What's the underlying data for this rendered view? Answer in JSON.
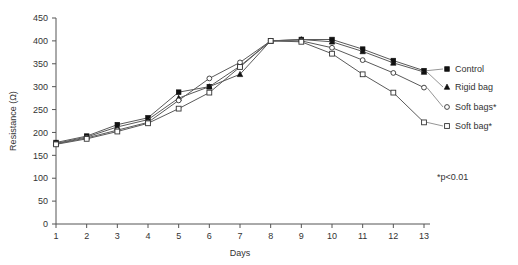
{
  "chart_data": {
    "type": "line",
    "title": "",
    "xlabel": "Days",
    "ylabel": "Resistance (Ω)",
    "x": [
      1,
      2,
      3,
      4,
      5,
      6,
      7,
      8,
      9,
      10,
      11,
      12,
      13
    ],
    "xtick_labels": [
      "1",
      "2",
      "3",
      "4",
      "5",
      "6",
      "7",
      "8",
      "9",
      "10",
      "11",
      "12",
      "13"
    ],
    "ytick_labels": [
      "0",
      "50",
      "100",
      "150",
      "200",
      "250",
      "300",
      "350",
      "400",
      "450"
    ],
    "yticks": [
      0,
      50,
      100,
      150,
      200,
      250,
      300,
      350,
      400,
      450
    ],
    "ylim": [
      0,
      450
    ],
    "xlim": [
      1,
      13
    ],
    "grid": false,
    "legend_position": "right-outside",
    "annotation": "*p<0.01",
    "series": [
      {
        "name": "Control",
        "marker": "filled-square",
        "values": [
          178,
          192,
          217,
          232,
          288,
          300,
          345,
          400,
          403,
          403,
          382,
          357,
          335
        ]
      },
      {
        "name": "Rigid bag",
        "marker": "filled-triangle",
        "values": [
          176,
          190,
          212,
          228,
          275,
          300,
          327,
          400,
          403,
          398,
          377,
          352,
          332
        ]
      },
      {
        "name": "Soft bags*",
        "marker": "open-circle",
        "values": [
          175,
          188,
          205,
          222,
          270,
          318,
          353,
          400,
          400,
          385,
          358,
          330,
          298
        ]
      },
      {
        "name": "Soft bag*",
        "marker": "open-square",
        "values": [
          174,
          186,
          202,
          220,
          252,
          287,
          343,
          400,
          398,
          372,
          327,
          287,
          222
        ]
      }
    ]
  },
  "legend": {
    "items": [
      {
        "label": "Control"
      },
      {
        "label": "Rigid bag"
      },
      {
        "label": "Soft bags*"
      },
      {
        "label": "Soft bag*"
      }
    ]
  }
}
